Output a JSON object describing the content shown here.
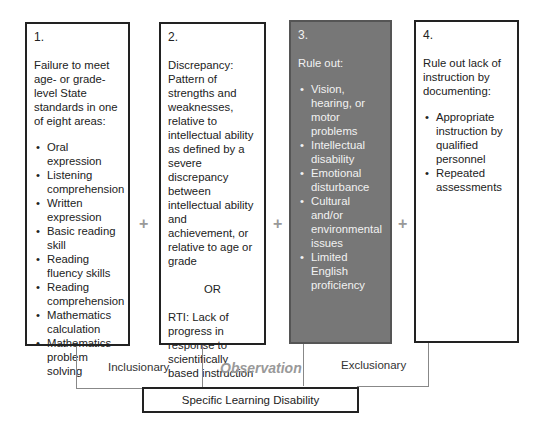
{
  "boxes": [
    {
      "number": "1.",
      "intro": "Failure to meet age- or grade-level State standards in one of eight areas:",
      "items": [
        "Oral expression",
        "Listening comprehension",
        "Written expression",
        "Basic reading skill",
        "Reading fluency skills",
        "Reading comprehension",
        "Mathematics calculation",
        "Mathematics problem solving"
      ]
    },
    {
      "number": "2.",
      "intro": "Discrepancy: Pattern of strengths and weaknesses, relative to intellectual ability as defined by a severe discrepancy between intellectual ability and achievement, or relative to age or grade",
      "or_label": "OR",
      "rti": "RTI: Lack of progress in response to scientifically based instruction"
    },
    {
      "number": "3.",
      "intro": "Rule out:",
      "items": [
        "Vision, hearing, or motor problems",
        "Intellectual disability",
        "Emotional disturbance",
        "Cultural and/or environmental issues",
        "Limited English proficiency"
      ]
    },
    {
      "number": "4.",
      "intro": "Rule out lack of instruction by documenting:",
      "items": [
        "Appropriate instruction by qualified personnel",
        "Repeated assessments"
      ]
    }
  ],
  "connectors": {
    "plus": "+"
  },
  "bracket": {
    "inclusionary": "Inclusionary",
    "observation": "Observation",
    "exclusionary": "Exclusionary"
  },
  "result": {
    "label": "Specific Learning Disability"
  },
  "colors": {
    "dark_box": "#777777",
    "plus": "#999999",
    "observation": "#999999"
  }
}
